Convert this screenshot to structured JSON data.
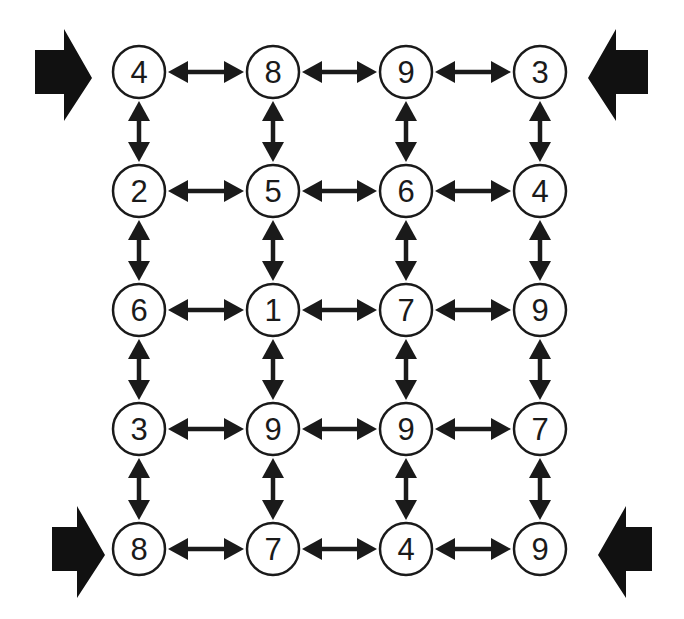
{
  "diagram": {
    "type": "number-grid-graph",
    "rows": 5,
    "cols": 4,
    "grid": [
      [
        4,
        8,
        9,
        3
      ],
      [
        2,
        5,
        6,
        4
      ],
      [
        6,
        1,
        7,
        9
      ],
      [
        3,
        9,
        9,
        7
      ],
      [
        8,
        7,
        4,
        9
      ]
    ],
    "connections": "all orthogonally adjacent nodes joined by double-headed arrows",
    "entry_arrows": [
      {
        "position": "top-left",
        "row": 0,
        "side": "left",
        "direction": "right"
      },
      {
        "position": "top-right",
        "row": 0,
        "side": "right",
        "direction": "left"
      },
      {
        "position": "bottom-left",
        "row": 4,
        "side": "left",
        "direction": "right"
      },
      {
        "position": "bottom-right",
        "row": 4,
        "side": "right",
        "direction": "left"
      }
    ],
    "colors": {
      "background": "#ffffff",
      "stroke": "#1a1a1a",
      "node_fill": "#ffffff",
      "arrow_fill": "#111111"
    }
  }
}
